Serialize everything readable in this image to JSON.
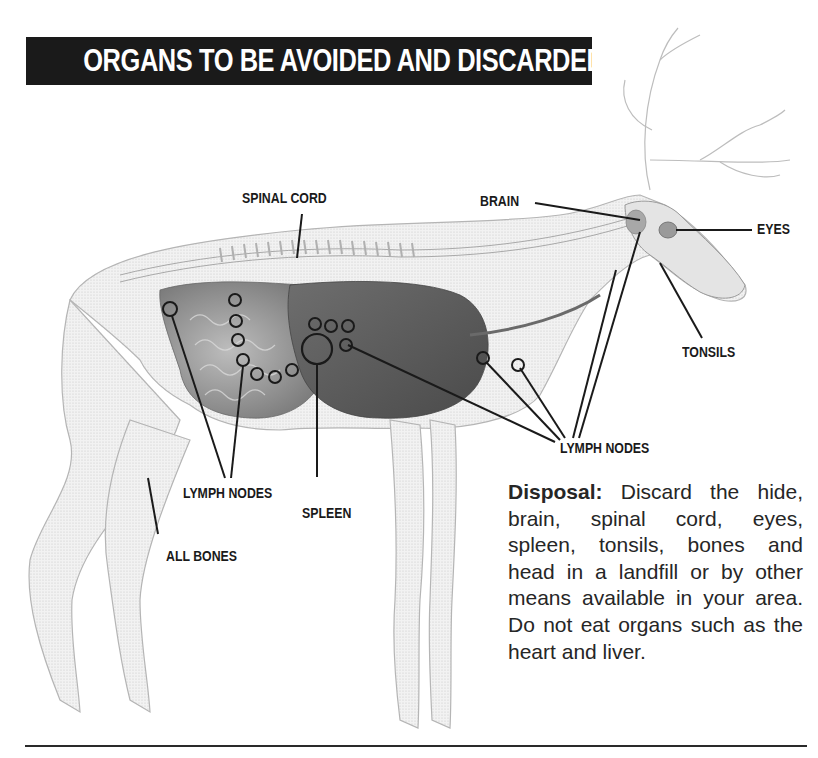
{
  "title": "ORGANS TO BE AVOIDED AND DISCARDED",
  "labels": {
    "spinal_cord": "SPINAL CORD",
    "brain": "BRAIN",
    "eyes": "EYES",
    "tonsils": "TONSILS",
    "lymph_nodes_right": "LYMPH NODES",
    "lymph_nodes_left": "LYMPH NODES",
    "spleen": "SPLEEN",
    "all_bones": "ALL BONES"
  },
  "disposal": {
    "heading": "Disposal:",
    "text": " Discard the hide, brain, spinal cord, eyes, spleen, tonsils, bones and head in a landfill or by other means available in your area. Do not eat organs such as the heart and liver."
  },
  "colors": {
    "title_bg": "#1a1a1a",
    "title_fg": "#ffffff",
    "ink": "#1a1a1a",
    "organ_dark": "#5a5a5a",
    "organ_mid": "#8a8a8a",
    "bone_light": "#e6e6e6"
  }
}
